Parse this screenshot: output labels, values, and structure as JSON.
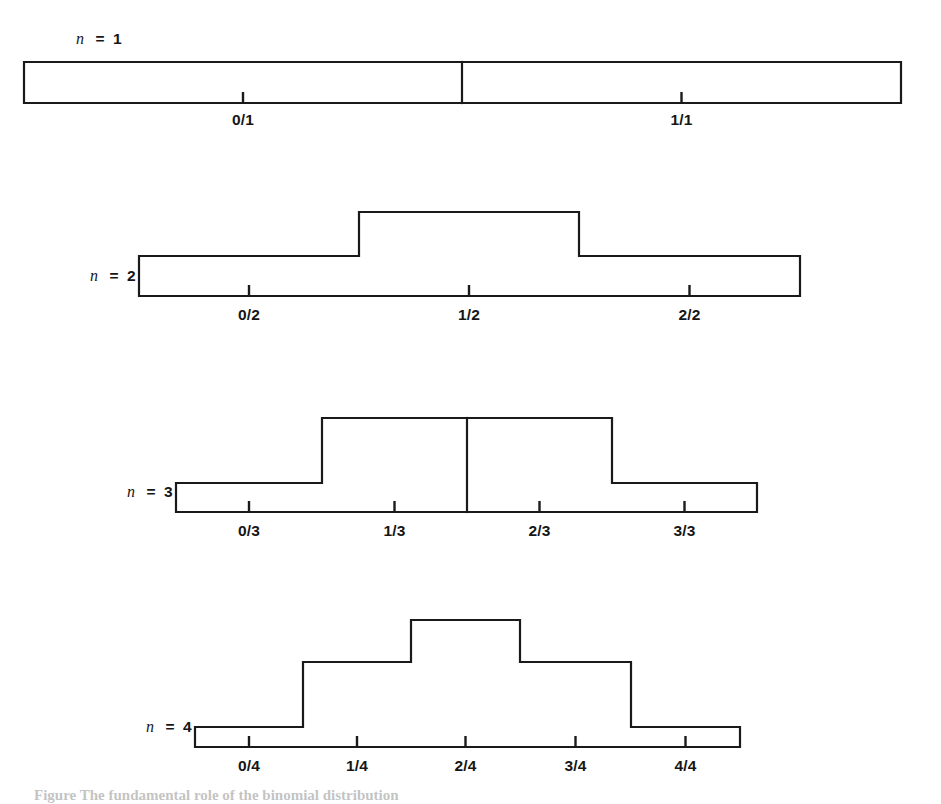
{
  "figure": {
    "background_color": "#ffffff",
    "line_color": "#1a1a1a",
    "caption": "Figure  The fundamental role of the binomial distribution",
    "rows": [
      {
        "id": "row-n1",
        "n_symbol": "n",
        "equals": "=",
        "n_value": "1",
        "label_x": 118,
        "label_y": 44,
        "baseline_y": 103,
        "x_start": 24,
        "x_end": 901,
        "bars": [
          {
            "label": "0/1",
            "x0": 24,
            "x1": 462,
            "top_y": 62
          },
          {
            "label": "1/1",
            "x0": 462,
            "x1": 901,
            "top_y": 62
          }
        ],
        "tick_labels": [
          "0/1",
          "1/1"
        ],
        "tick_label_y": 125
      },
      {
        "id": "row-n2",
        "n_symbol": "n",
        "equals": "=",
        "n_value": "2",
        "label_x": 132,
        "label_y": 281,
        "baseline_y": 296,
        "x_start": 139,
        "x_end": 800,
        "bars": [
          {
            "label": "0/2",
            "x0": 139,
            "x1": 359,
            "top_y": 256
          },
          {
            "label": "1/2",
            "x0": 359,
            "x1": 579,
            "top_y": 212
          },
          {
            "label": "2/2",
            "x0": 579,
            "x1": 800,
            "top_y": 256
          }
        ],
        "tick_labels": [
          "0/2",
          "1/2",
          "2/2"
        ],
        "tick_label_y": 320
      },
      {
        "id": "row-n3",
        "n_symbol": "n",
        "equals": "=",
        "n_value": "3",
        "label_x": 169,
        "label_y": 497,
        "baseline_y": 512,
        "x_start": 176,
        "x_end": 757,
        "bars": [
          {
            "label": "0/3",
            "x0": 176,
            "x1": 322,
            "top_y": 483
          },
          {
            "label": "1/3",
            "x0": 322,
            "x1": 467,
            "top_y": 418
          },
          {
            "label": "2/3",
            "x0": 467,
            "x1": 612,
            "top_y": 418
          },
          {
            "label": "3/3",
            "x0": 612,
            "x1": 757,
            "top_y": 483
          }
        ],
        "tick_labels": [
          "0/3",
          "1/3",
          "2/3",
          "3/3"
        ],
        "tick_label_y": 536
      },
      {
        "id": "row-n4",
        "n_symbol": "n",
        "equals": "=",
        "n_value": "4",
        "label_x": 188,
        "label_y": 732,
        "baseline_y": 747,
        "x_start": 195,
        "x_end": 740,
        "bars": [
          {
            "label": "0/4",
            "x0": 195,
            "x1": 303,
            "top_y": 727
          },
          {
            "label": "1/4",
            "x0": 303,
            "x1": 411,
            "top_y": 662
          },
          {
            "label": "2/4",
            "x0": 411,
            "x1": 520,
            "top_y": 620
          },
          {
            "label": "3/4",
            "x0": 520,
            "x1": 631,
            "top_y": 662
          },
          {
            "label": "4/4",
            "x0": 631,
            "x1": 740,
            "top_y": 727
          }
        ],
        "tick_labels": [
          "0/4",
          "1/4",
          "2/4",
          "3/4",
          "4/4"
        ],
        "tick_label_y": 771
      }
    ]
  },
  "chart_data": {
    "type": "bar",
    "xlabel": "",
    "ylabel": "",
    "grid": false,
    "legend": "none",
    "note": "Four stacked histograms; each bar's height is proportional to the binomial coefficient C(n,k). Bin labels are written as k/n and are centered beneath each bar.",
    "panels": [
      {
        "name": "n = 1",
        "n": 1,
        "categories": [
          "0/1",
          "1/1"
        ],
        "values": [
          1,
          1
        ],
        "bar_pixel_heights": [
          41,
          41
        ]
      },
      {
        "name": "n = 2",
        "n": 2,
        "categories": [
          "0/2",
          "1/2",
          "2/2"
        ],
        "values": [
          1,
          2,
          1
        ],
        "bar_pixel_heights": [
          40,
          84,
          40
        ]
      },
      {
        "name": "n = 3",
        "n": 3,
        "categories": [
          "0/3",
          "1/3",
          "2/3",
          "3/3"
        ],
        "values": [
          1,
          3,
          3,
          1
        ],
        "bar_pixel_heights": [
          29,
          94,
          94,
          29
        ]
      },
      {
        "name": "n = 4",
        "n": 4,
        "categories": [
          "0/4",
          "1/4",
          "2/4",
          "3/4",
          "4/4"
        ],
        "values": [
          1,
          4,
          6,
          4,
          1
        ],
        "bar_pixel_heights": [
          20,
          85,
          127,
          85,
          20
        ]
      }
    ]
  }
}
